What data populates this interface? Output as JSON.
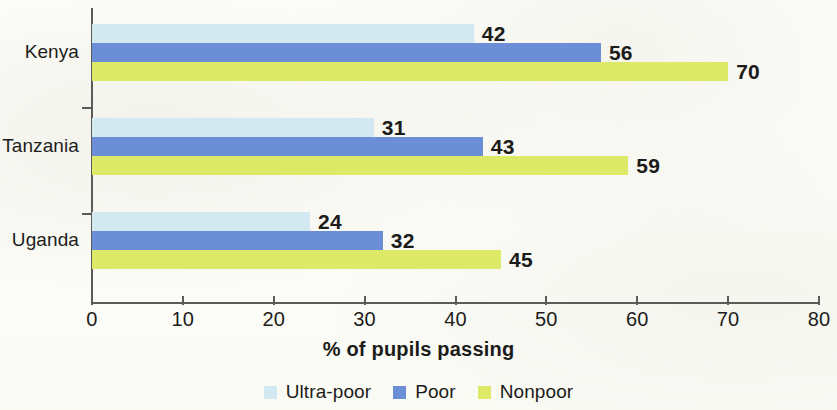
{
  "chart_data": {
    "type": "bar",
    "orientation": "horizontal",
    "title": "",
    "subtitle": "",
    "xlabel": "% of pupils passing",
    "ylabel": "",
    "xlim": [
      0,
      80
    ],
    "xticks": [
      0,
      10,
      20,
      30,
      40,
      50,
      60,
      70,
      80
    ],
    "grid": false,
    "legend_position": "bottom-center",
    "categories": [
      "Kenya",
      "Tanzania",
      "Uganda"
    ],
    "series": [
      {
        "name": "Ultra-poor",
        "color": "#d2e9f2",
        "values": [
          42,
          31,
          24
        ]
      },
      {
        "name": "Poor",
        "color": "#6b8ed6",
        "values": [
          56,
          43,
          32
        ]
      },
      {
        "name": "Nonpoor",
        "color": "#dcea68",
        "values": [
          70,
          59,
          45
        ]
      }
    ],
    "data_labels": [
      "42",
      "56",
      "70",
      "31",
      "43",
      "59",
      "24",
      "32",
      "45"
    ]
  },
  "axis": {
    "x_tick_labels": [
      "0",
      "10",
      "20",
      "30",
      "40",
      "50",
      "60",
      "70",
      "80"
    ],
    "x_title": "% of pupils passing"
  },
  "category_labels": [
    "Kenya",
    "Tanzania",
    "Uganda"
  ],
  "legend": {
    "items": [
      {
        "label": "Ultra-poor",
        "color": "#d2e9f2"
      },
      {
        "label": "Poor",
        "color": "#6b8ed6"
      },
      {
        "label": "Nonpoor",
        "color": "#dcea68"
      }
    ]
  },
  "bars": [
    {
      "label": "42",
      "value": 42,
      "series": "Ultra-poor",
      "category": "Kenya"
    },
    {
      "label": "56",
      "value": 56,
      "series": "Poor",
      "category": "Kenya"
    },
    {
      "label": "70",
      "value": 70,
      "series": "Nonpoor",
      "category": "Kenya"
    },
    {
      "label": "31",
      "value": 31,
      "series": "Ultra-poor",
      "category": "Tanzania"
    },
    {
      "label": "43",
      "value": 43,
      "series": "Poor",
      "category": "Tanzania"
    },
    {
      "label": "59",
      "value": 59,
      "series": "Nonpoor",
      "category": "Tanzania"
    },
    {
      "label": "24",
      "value": 24,
      "series": "Ultra-poor",
      "category": "Uganda"
    },
    {
      "label": "32",
      "value": 32,
      "series": "Poor",
      "category": "Uganda"
    },
    {
      "label": "45",
      "value": 45,
      "series": "Nonpoor",
      "category": "Uganda"
    }
  ]
}
